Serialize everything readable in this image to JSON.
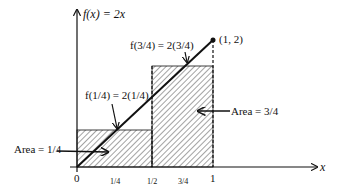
{
  "title": "f(x) = 2x",
  "point_label": "(1, 2)",
  "label_f34": "f(3/4) = 2(3/4)",
  "label_f14": "f(1/4) = 2(1/4)",
  "area_left": "Area = 1/4",
  "area_right": "Area = 3/4",
  "x_axis_label": "x",
  "x_ticks": [
    "0",
    "1/4",
    "1/2",
    "3/4",
    "1"
  ],
  "colors": {
    "ink": "#111111",
    "background": "#ffffff"
  }
}
